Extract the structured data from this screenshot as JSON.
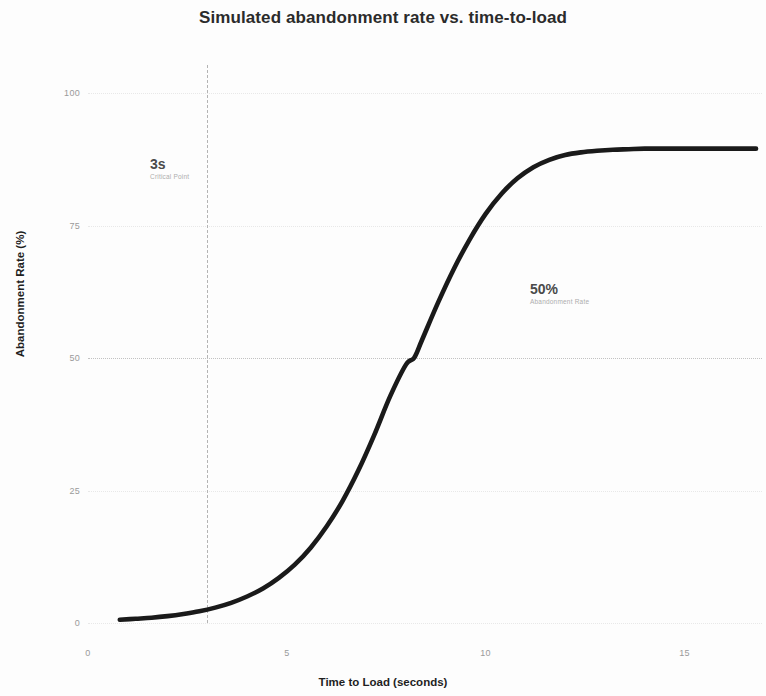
{
  "chart_data": {
    "type": "line",
    "title": "Simulated abandonment rate vs. time-to-load",
    "xlabel": "Time to Load (seconds)",
    "ylabel": "Abandonment Rate (%)",
    "xlim": [
      0.0,
      16.95
    ],
    "ylim": [
      0,
      100
    ],
    "xticks": [
      0,
      5,
      10,
      15
    ],
    "xtick_labels": [
      "0",
      "5",
      "10",
      "15"
    ],
    "yticks": [
      0,
      25,
      50,
      75,
      100
    ],
    "ytick_labels": [
      "0",
      "25",
      "50",
      "75",
      "100"
    ],
    "grid": true,
    "legend": false,
    "series": [
      {
        "name": "Abandonment rate",
        "color": "#1a1a1a",
        "x": [
          0.8,
          1.2,
          1.6,
          2.0,
          2.4,
          2.8,
          3.2,
          3.6,
          4.0,
          4.4,
          4.8,
          5.2,
          5.6,
          6.0,
          6.4,
          6.8,
          7.2,
          7.6,
          8.0,
          8.2,
          8.4,
          8.8,
          9.2,
          9.6,
          10.0,
          10.4,
          10.8,
          11.2,
          11.6,
          12.0,
          12.4,
          12.8,
          13.2,
          13.6,
          14.0,
          14.8,
          15.6,
          16.4,
          16.8
        ],
        "y": [
          0.6,
          0.8,
          1.0,
          1.3,
          1.7,
          2.2,
          2.9,
          3.8,
          5.0,
          6.5,
          8.5,
          11.0,
          14.2,
          18.2,
          23.0,
          28.8,
          35.5,
          42.8,
          48.8,
          50.0,
          53.4,
          60.4,
          66.8,
          72.4,
          77.2,
          81.0,
          83.9,
          86.0,
          87.4,
          88.3,
          88.8,
          89.1,
          89.3,
          89.4,
          89.5,
          89.5,
          89.5,
          89.5,
          89.5
        ]
      }
    ],
    "reference_lines": [
      {
        "name": "critical-point",
        "orientation": "vertical",
        "value": 3,
        "style": "dashed",
        "color": "#b4b4b4"
      },
      {
        "name": "midpoint",
        "orientation": "horizontal",
        "value": 50,
        "style": "dotted",
        "color": "#c2c2c2"
      }
    ],
    "annotations": [
      {
        "name": "critical-point",
        "value": "3s",
        "caption": "Critical Point"
      },
      {
        "name": "midpoint",
        "value": "50%",
        "caption": "Abandonment Rate"
      }
    ]
  }
}
